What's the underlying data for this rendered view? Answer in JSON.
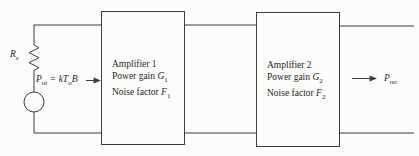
{
  "diagram": {
    "source": {
      "resistor_symbol": "R",
      "resistor_sub": "s"
    },
    "input_label": {
      "p": "P",
      "p_sub": "ni",
      "eq": "=",
      "k": "k",
      "t": "T",
      "t_sub": "o",
      "b": "B"
    },
    "amplifiers": [
      {
        "title": "Amplifier 1",
        "gain_prefix": "Power gain ",
        "gain_symbol": "G",
        "gain_sub": "1",
        "noise_prefix": "Noise factor ",
        "noise_symbol": "F",
        "noise_sub": "1"
      },
      {
        "title": "Amplifier 2",
        "gain_prefix": "Power gain ",
        "gain_symbol": "G",
        "gain_sub": "2",
        "noise_prefix": "Noise factor ",
        "noise_symbol": "F",
        "noise_sub": "2"
      }
    ],
    "output_label": {
      "p": "P",
      "p_sub": "no"
    }
  },
  "icons": {
    "resistor": "resistor-zigzag-icon",
    "source": "source-circle-icon",
    "input_arrow": "right-arrow-icon",
    "output_arrow": "right-arrow-icon"
  },
  "colors": {
    "line": "#3d3d3d",
    "text": "#1f1f1f",
    "background": "#fcfcfa"
  }
}
